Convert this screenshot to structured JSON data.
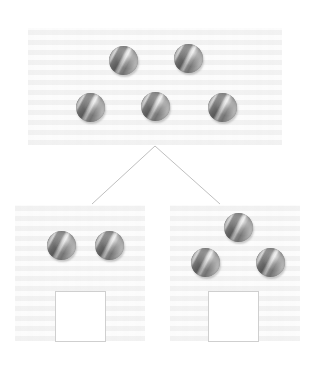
{
  "diagram": {
    "kind": "number-bond-part-whole-tree",
    "background_color": "#ffffff",
    "panel_color": "#fafafa",
    "connector_color": "#bfbfbf",
    "answer_box_border_color": "#cfcfcf",
    "marble_color": "#8f8f8f"
  },
  "whole": {
    "label": "whole-group",
    "marble_count": 5,
    "panel": {
      "x": 28,
      "y": 28,
      "w": 254,
      "h": 117
    },
    "marbles": [
      {
        "name": "whole-marble-1",
        "x": 109,
        "y": 46,
        "size": 29
      },
      {
        "name": "whole-marble-2",
        "x": 174,
        "y": 44,
        "size": 29
      },
      {
        "name": "whole-marble-3",
        "x": 76,
        "y": 93,
        "size": 29
      },
      {
        "name": "whole-marble-4",
        "x": 141,
        "y": 92,
        "size": 29
      },
      {
        "name": "whole-marble-5",
        "x": 208,
        "y": 93,
        "size": 29
      }
    ]
  },
  "connectors": {
    "apex": {
      "x": 155,
      "y": 146
    },
    "left_end": {
      "x": 92,
      "y": 204
    },
    "right_end": {
      "x": 220,
      "y": 204
    },
    "stroke_width": 1
  },
  "parts": [
    {
      "label": "part-left",
      "marble_count": 2,
      "panel": {
        "x": 15,
        "y": 205,
        "w": 130,
        "h": 136
      },
      "marbles": [
        {
          "name": "part-left-marble-1",
          "x": 47,
          "y": 231,
          "size": 29
        },
        {
          "name": "part-left-marble-2",
          "x": 95,
          "y": 231,
          "size": 29
        }
      ],
      "answer_box": {
        "x": 55,
        "y": 291,
        "w": 51,
        "h": 51,
        "value": ""
      }
    },
    {
      "label": "part-right",
      "marble_count": 3,
      "panel": {
        "x": 170,
        "y": 205,
        "w": 130,
        "h": 136
      },
      "marbles": [
        {
          "name": "part-right-marble-1",
          "x": 224,
          "y": 213,
          "size": 29
        },
        {
          "name": "part-right-marble-2",
          "x": 191,
          "y": 248,
          "size": 29
        },
        {
          "name": "part-right-marble-3",
          "x": 256,
          "y": 248,
          "size": 29
        }
      ],
      "answer_box": {
        "x": 208,
        "y": 291,
        "w": 51,
        "h": 51,
        "value": ""
      }
    }
  ]
}
